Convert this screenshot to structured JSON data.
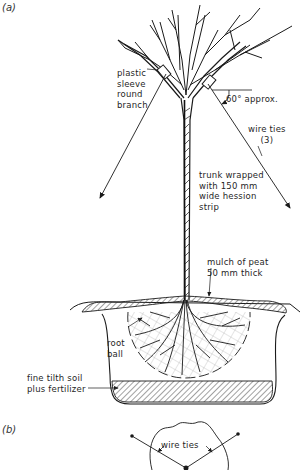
{
  "figure": {
    "panel_a_label": "(a)",
    "panel_b_label": "(b)"
  },
  "labels": {
    "plastic_sleeve": "plastic\nsleeve\nround\nbranch",
    "angle": "60° approx.",
    "wire_ties": "wire ties\n(3)",
    "trunk_wrap": "trunk wrapped\nwith 150 mm\nwide hession\nstrip",
    "mulch": "mulch of peat\n50 mm thick",
    "root_ball": "root\nball",
    "soil": "fine tilth soil\nplus fertilizer",
    "plan_wire_ties": "wire ties"
  },
  "colors": {
    "ink": "#1a1a1a",
    "background": "#ffffff",
    "hatch": "#555555"
  }
}
